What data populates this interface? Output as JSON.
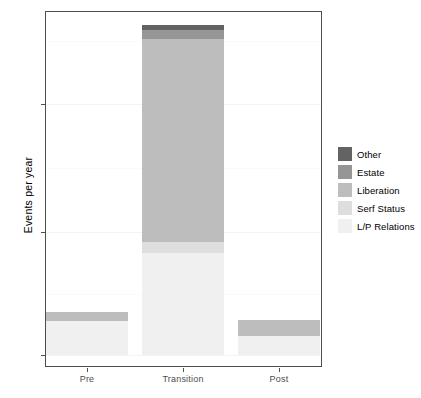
{
  "chart_data": {
    "type": "bar",
    "stacked": true,
    "title": "",
    "subtitle": "",
    "xlabel": "",
    "ylabel": "Events per year",
    "categories": [
      "Pre",
      "Transition",
      "Post"
    ],
    "ylim": [
      0,
      278
    ],
    "yticks": [
      0,
      100,
      200
    ],
    "ytick_labels": [
      "0",
      "100",
      "200"
    ],
    "grid": true,
    "legend_position": "right",
    "legend_title": "",
    "series": [
      {
        "name": "Other",
        "color": "#636363",
        "values": [
          0,
          4,
          0
        ]
      },
      {
        "name": "Estate",
        "color": "#969696",
        "values": [
          0,
          7,
          0
        ]
      },
      {
        "name": "Liberation",
        "color": "#bdbdbd",
        "values": [
          7,
          162,
          13
        ]
      },
      {
        "name": "Serf Status",
        "color": "#dedede",
        "values": [
          0,
          9,
          0
        ]
      },
      {
        "name": "L/P Relations",
        "color": "#f0f0f0",
        "values": [
          27,
          81,
          15
        ]
      }
    ],
    "totals": [
      34,
      263,
      28
    ]
  },
  "legend": {
    "items": [
      {
        "label": "Other"
      },
      {
        "label": "Estate"
      },
      {
        "label": "Liberation"
      },
      {
        "label": "Serf Status"
      },
      {
        "label": "L/P Relations"
      }
    ]
  },
  "axes": {
    "y_title": "Events per year",
    "y_tick_labels": [
      "200",
      "100",
      "0"
    ],
    "x_tick_labels": [
      "Pre",
      "Transition",
      "Post"
    ]
  }
}
